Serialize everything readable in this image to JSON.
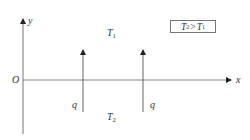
{
  "diagram": {
    "axes": {
      "x_label": "x",
      "y_label": "y",
      "origin_label": "O"
    },
    "regions": {
      "upper": {
        "symbol": "T",
        "subscript": "1"
      },
      "lower": {
        "symbol": "T",
        "subscript": "2"
      }
    },
    "charges": [
      {
        "label": "q",
        "direction": "up"
      },
      {
        "label": "q",
        "direction": "up"
      }
    ],
    "legend": {
      "left_symbol": "T",
      "left_subscript": "2",
      "relation": ">",
      "right_symbol": "T",
      "right_subscript": "1"
    },
    "colors": {
      "line": "#555555",
      "text": "#333333",
      "background": "#ffffff"
    }
  }
}
